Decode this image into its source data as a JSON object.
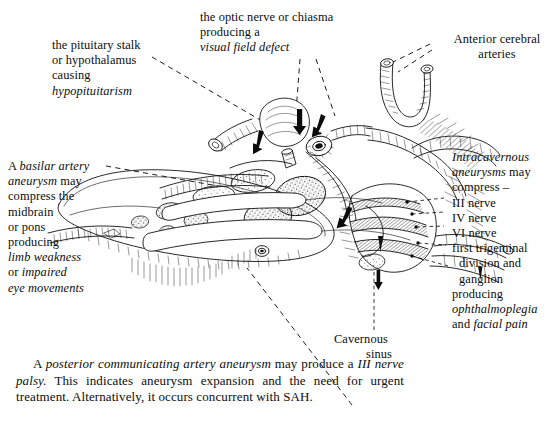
{
  "figure": {
    "kind": "anatomical-line-drawing",
    "ink_color": "#111111",
    "background": "#ffffff"
  },
  "labels": {
    "pituitary": {
      "name": "pituitary-stalk-label",
      "lines": [
        {
          "text": "the pituitary stalk",
          "style": "roman"
        },
        {
          "text": "or hypothalamus",
          "style": "roman"
        },
        {
          "text": "causing",
          "style": "roman"
        },
        {
          "text": "hypopituitarism",
          "style": "italic"
        }
      ]
    },
    "optic": {
      "name": "optic-nerve-label",
      "lines": [
        {
          "text": "the optic nerve or chiasma",
          "style": "roman"
        },
        {
          "text": "producing a",
          "style": "roman"
        },
        {
          "text": "visual field defect",
          "style": "italic"
        }
      ]
    },
    "anterior_cerebral": {
      "name": "anterior-cerebral-arteries-label",
      "lines": [
        {
          "text": "Anterior cerebral",
          "style": "roman"
        },
        {
          "text": "arteries",
          "style": "roman"
        }
      ]
    },
    "basilar": {
      "name": "basilar-artery-aneurysm-label",
      "lines": [
        {
          "text": "A basilar artery",
          "style": "mixed",
          "a": "A ",
          "b": "basilar artery"
        },
        {
          "text": "aneurysm may",
          "style": "mixed",
          "a": "aneurysm",
          "b": " may"
        },
        {
          "text": "compress the",
          "style": "roman"
        },
        {
          "text": "midbrain",
          "style": "roman"
        },
        {
          "text": "or pons",
          "style": "roman"
        },
        {
          "text": "producing",
          "style": "roman"
        },
        {
          "text": "limb weakness",
          "style": "italic"
        },
        {
          "text": "or impaired",
          "style": "mixed",
          "a": "or ",
          "b": "impaired"
        },
        {
          "text": "eye movements",
          "style": "italic"
        }
      ]
    },
    "intracavernous": {
      "name": "intracavernous-aneurysms-label",
      "lines": [
        {
          "text": "Intracavernous",
          "style": "italic"
        },
        {
          "text": "aneurysms may",
          "style": "mixed",
          "a": "aneurysms",
          "b": " may"
        },
        {
          "text": "compress –",
          "style": "roman"
        },
        {
          "text": "III nerve",
          "style": "roman"
        },
        {
          "text": "IV nerve",
          "style": "roman"
        },
        {
          "text": "VI nerve",
          "style": "roman"
        },
        {
          "text": "first trigeminal",
          "style": "roman"
        },
        {
          "text": "division and",
          "style": "roman"
        },
        {
          "text": "ganglion",
          "style": "roman"
        },
        {
          "text": "producing",
          "style": "roman"
        },
        {
          "text": "ophthalmoplegia",
          "style": "italic"
        },
        {
          "text": "and facial pain",
          "style": "mixed",
          "a": "and ",
          "b": "facial pain"
        }
      ]
    },
    "cavernous_sinus": {
      "name": "cavernous-sinus-label",
      "lines": [
        {
          "text": "Cavernous",
          "style": "roman"
        },
        {
          "text": "sinus",
          "style": "roman"
        }
      ]
    }
  },
  "caption": {
    "name": "posterior-communicating-caption",
    "segments": [
      {
        "text": "A ",
        "style": "roman"
      },
      {
        "text": "posterior communicating artery aneurysm",
        "style": "italic"
      },
      {
        "text": " may produce a ",
        "style": "roman"
      },
      {
        "text": "III nerve palsy.",
        "style": "italic"
      },
      {
        "text": " This indicates aneurysm expansion and the need for urgent treatment. Alternatively, it occurs concurrent with SAH.",
        "style": "roman"
      }
    ]
  }
}
